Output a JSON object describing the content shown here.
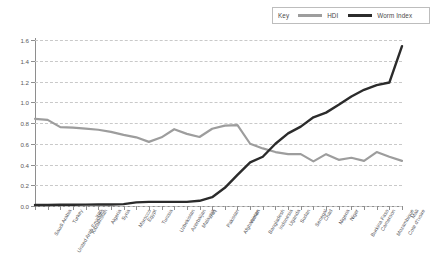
{
  "legend": {
    "key_label": "Key",
    "entries": [
      {
        "label": "HDI",
        "color": "#9d9d9d",
        "icon": "line-swatch-icon"
      },
      {
        "label": "Worm Index",
        "color": "#2b2b2b",
        "icon": "line-swatch-icon"
      }
    ]
  },
  "axes": {
    "y_ticks": [
      "0.0",
      "0.2",
      "0.4",
      "0.6",
      "0.8",
      "1.0",
      "1.2",
      "1.4",
      "1.6"
    ]
  },
  "chart_data": {
    "type": "line",
    "title": "",
    "subtitle": "",
    "xlabel": "",
    "ylabel": "",
    "ylim": [
      0.0,
      1.6
    ],
    "ytick_step": 0.2,
    "grid": true,
    "legend_position": "top-right",
    "categories": [
      "Saudi Arabia",
      "United Arab Emirates",
      "Turkey",
      "Kazakhstan",
      "Iran",
      "Algeria",
      "Syria",
      "Morocco",
      "Egypt",
      "Tunisia",
      "Uzbekistan",
      "Azerbaijan",
      "Malaysia",
      "Iraq",
      "Pakistan",
      "Afghanistan",
      "Yemen",
      "Bangladesh",
      "Indonesia",
      "Uganda",
      "Sudan",
      "Senegal",
      "Chad",
      "Nigeria",
      "Niger",
      "Burkina Faso",
      "Cameroon",
      "Mozambique",
      "Cote d'Ivoire",
      "Mali"
    ],
    "series": [
      {
        "name": "HDI",
        "color": "#9d9d9d",
        "values": [
          0.84,
          0.83,
          0.76,
          0.755,
          0.745,
          0.735,
          0.715,
          0.685,
          0.662,
          0.618,
          0.662,
          0.74,
          0.695,
          0.665,
          0.745,
          0.775,
          0.78,
          0.6,
          0.555,
          0.52,
          0.5,
          0.5,
          0.43,
          0.5,
          0.445,
          0.465,
          0.435,
          0.52,
          0.475,
          0.435
        ]
      },
      {
        "name": "Worm Index",
        "color": "#2b2b2b",
        "values": [
          0.01,
          0.01,
          0.012,
          0.012,
          0.013,
          0.014,
          0.015,
          0.018,
          0.035,
          0.04,
          0.04,
          0.04,
          0.04,
          0.05,
          0.085,
          0.175,
          0.3,
          0.42,
          0.475,
          0.6,
          0.7,
          0.765,
          0.855,
          0.9,
          0.975,
          1.055,
          1.12,
          1.165,
          1.19,
          1.54
        ]
      }
    ]
  }
}
